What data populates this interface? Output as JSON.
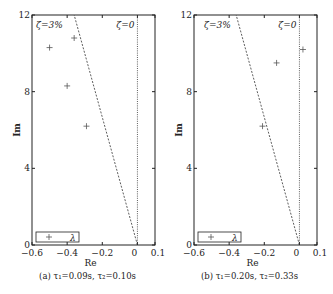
{
  "chart_data": [
    {
      "type": "scatter",
      "caption": "(a) τ₁=0.09s,  τ₂=0.10s",
      "xlabel": "Re",
      "ylabel": "Im",
      "xlim": [
        -0.6,
        0.1
      ],
      "ylim": [
        0,
        12
      ],
      "xticks": [
        "−0.6",
        "−0.4",
        "−0.2",
        "0",
        "0.1"
      ],
      "yticks": [
        "0",
        "4",
        "8",
        "12"
      ],
      "legend": "λ",
      "annotations": [
        "ζ=3%",
        "ζ=0"
      ],
      "series": [
        {
          "name": "λ",
          "points": [
            [
              -0.5,
              10.3
            ],
            [
              -0.36,
              10.8
            ],
            [
              -0.4,
              8.3
            ],
            [
              -0.29,
              6.2
            ]
          ]
        }
      ],
      "lines": [
        {
          "name": "ζ=3%",
          "from": [
            0,
            0
          ],
          "to": [
            -0.36,
            12
          ]
        },
        {
          "name": "ζ=0",
          "from": [
            0,
            0
          ],
          "to": [
            0,
            12
          ]
        }
      ]
    },
    {
      "type": "scatter",
      "caption": "(b) τ₁=0.20s,  τ₂=0.33s",
      "xlabel": "Re",
      "ylabel": "Im",
      "xlim": [
        -0.6,
        0.1
      ],
      "ylim": [
        0,
        12
      ],
      "xticks": [
        "−0.6",
        "−0.4",
        "−0.2",
        "0",
        "0.1"
      ],
      "yticks": [
        "0",
        "4",
        "8",
        "12"
      ],
      "legend": "λ",
      "annotations": [
        "ζ=3%",
        "ζ=0"
      ],
      "series": [
        {
          "name": "λ",
          "points": [
            [
              0.02,
              10.2
            ],
            [
              -0.13,
              9.5
            ],
            [
              -0.21,
              6.2
            ]
          ]
        }
      ],
      "lines": [
        {
          "name": "ζ=3%",
          "from": [
            0,
            0
          ],
          "to": [
            -0.36,
            12
          ]
        },
        {
          "name": "ζ=0",
          "from": [
            0,
            0
          ],
          "to": [
            0,
            12
          ]
        }
      ]
    }
  ]
}
